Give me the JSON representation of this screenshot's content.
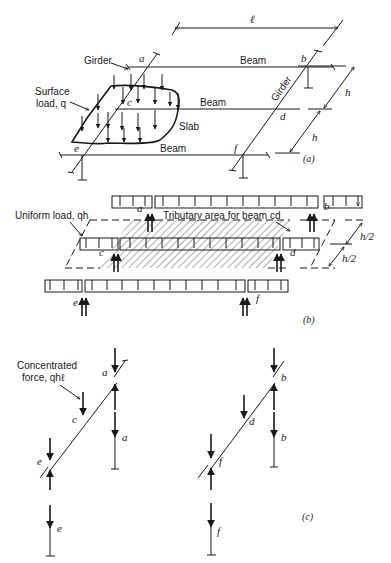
{
  "figure": {
    "part_a": {
      "caption": "(a)",
      "labels": {
        "girder_left": "Girder",
        "girder_right": "Girder",
        "beam_top": "Beam",
        "beam_mid": "Beam",
        "beam_bottom": "Beam",
        "surface_load_1": "Surface",
        "surface_load_2": "load, q",
        "slab": "Slab",
        "span": "ℓ",
        "spacing_1": "h",
        "spacing_2": "h"
      },
      "points": {
        "a": "a",
        "b": "b",
        "c": "c",
        "d": "d",
        "e": "e",
        "f": "f"
      }
    },
    "part_b": {
      "caption": "(b)",
      "labels": {
        "uniform_load": "Uniform load, qh",
        "tributary": "Tributary area for beam cd",
        "half_1": "h/2",
        "half_2": "h/2"
      },
      "points": {
        "a": "a",
        "b": "b",
        "c": "c",
        "d": "d",
        "e": "e",
        "f": "f"
      }
    },
    "part_c": {
      "caption": "(c)",
      "labels": {
        "conc_1": "Concentrated",
        "conc_2": "force, qhℓ"
      },
      "points": {
        "a1": "a",
        "a2": "a",
        "b1": "b",
        "b2": "b",
        "c": "c",
        "d": "d",
        "e1": "e",
        "e2": "e",
        "f1": "f",
        "f2": "f"
      }
    }
  }
}
